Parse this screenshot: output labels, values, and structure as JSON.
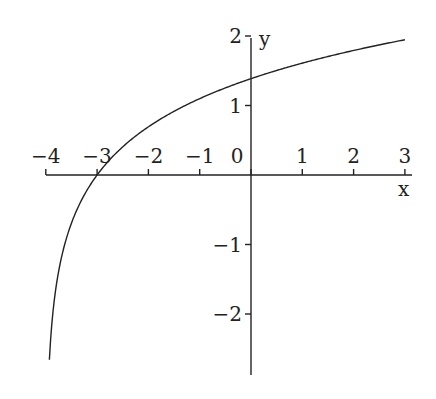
{
  "chart_data": {
    "type": "line",
    "title": "",
    "function": "y = ln(x + 4)",
    "xlabel": "x",
    "ylabel": "y",
    "xlim": [
      -4,
      3
    ],
    "ylim": [
      -2.6,
      2
    ],
    "x_ticks": [
      -4,
      -3,
      -2,
      -1,
      0,
      1,
      2,
      3
    ],
    "x_tick_labels": [
      "−4",
      "−3",
      "−2",
      "−1",
      "0",
      "1",
      "2",
      "3"
    ],
    "y_ticks": [
      2,
      1,
      -1,
      -2
    ],
    "y_tick_labels": [
      "2",
      "1",
      "−1",
      "−2"
    ],
    "grid": false,
    "series": [
      {
        "name": "curve",
        "x": [
          -3.93,
          -3.9,
          -3.8,
          -3.5,
          -3.0,
          -2.5,
          -2.0,
          -1.0,
          0.0,
          1.0,
          2.0,
          3.0
        ],
        "y": [
          -2.66,
          -2.3,
          -1.61,
          -0.69,
          0.0,
          0.41,
          0.69,
          1.1,
          1.39,
          1.61,
          1.79,
          1.95
        ]
      }
    ]
  }
}
